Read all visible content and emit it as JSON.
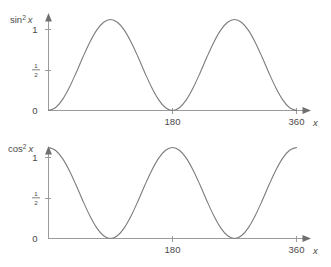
{
  "figure": {
    "background_color": "#ffffff",
    "curve_color": "#7c7c7c",
    "axis_color": "#9b9b9b",
    "text_color": "#4a4a4a"
  },
  "charts": [
    {
      "id": "sin-squared",
      "y_axis_title_base": "sin",
      "y_axis_title_exp": "2",
      "y_axis_title_var": "x",
      "x_axis_title": "x",
      "y_ticks": [
        "1",
        "0"
      ],
      "y_half_num": "1",
      "y_half_den": "2",
      "x_ticks": [
        "180",
        "360"
      ]
    },
    {
      "id": "cos-squared",
      "y_axis_title_base": "cos",
      "y_axis_title_exp": "2",
      "y_axis_title_var": "x",
      "x_axis_title": "x",
      "y_ticks": [
        "1",
        "0"
      ],
      "y_half_num": "1",
      "y_half_den": "2",
      "x_ticks": [
        "180",
        "360"
      ]
    }
  ],
  "chart_data": [
    {
      "type": "line",
      "title": "sin^2 x",
      "xlabel": "x",
      "ylabel": "sin^2 x",
      "xlim": [
        0,
        360
      ],
      "ylim": [
        0,
        1
      ],
      "xticks": [
        180,
        360
      ],
      "yticks": [
        0,
        0.5,
        1
      ],
      "ytick_labels": [
        "0",
        "1/2",
        "1"
      ],
      "grid": false,
      "legend": false,
      "series": [
        {
          "name": "sin^2 x",
          "x": [
            0,
            10,
            20,
            30,
            40,
            50,
            60,
            70,
            80,
            90,
            100,
            110,
            120,
            130,
            140,
            150,
            160,
            170,
            180,
            190,
            200,
            210,
            220,
            230,
            240,
            250,
            260,
            270,
            280,
            290,
            300,
            310,
            320,
            330,
            340,
            350,
            360
          ],
          "y": [
            0.0,
            0.03,
            0.117,
            0.25,
            0.413,
            0.587,
            0.75,
            0.883,
            0.97,
            1.0,
            0.97,
            0.883,
            0.75,
            0.587,
            0.413,
            0.25,
            0.117,
            0.03,
            0.0,
            0.03,
            0.117,
            0.25,
            0.413,
            0.587,
            0.75,
            0.883,
            0.97,
            1.0,
            0.97,
            0.883,
            0.75,
            0.587,
            0.413,
            0.25,
            0.117,
            0.03,
            0.0
          ]
        }
      ]
    },
    {
      "type": "line",
      "title": "cos^2 x",
      "xlabel": "x",
      "ylabel": "cos^2 x",
      "xlim": [
        0,
        360
      ],
      "ylim": [
        0,
        1
      ],
      "xticks": [
        180,
        360
      ],
      "yticks": [
        0,
        0.5,
        1
      ],
      "ytick_labels": [
        "0",
        "1/2",
        "1"
      ],
      "grid": false,
      "legend": false,
      "series": [
        {
          "name": "cos^2 x",
          "x": [
            0,
            10,
            20,
            30,
            40,
            50,
            60,
            70,
            80,
            90,
            100,
            110,
            120,
            130,
            140,
            150,
            160,
            170,
            180,
            190,
            200,
            210,
            220,
            230,
            240,
            250,
            260,
            270,
            280,
            290,
            300,
            310,
            320,
            330,
            340,
            350,
            360
          ],
          "y": [
            1.0,
            0.97,
            0.883,
            0.75,
            0.587,
            0.413,
            0.25,
            0.117,
            0.03,
            0.0,
            0.03,
            0.117,
            0.25,
            0.413,
            0.587,
            0.75,
            0.883,
            0.97,
            1.0,
            0.97,
            0.883,
            0.75,
            0.587,
            0.413,
            0.25,
            0.117,
            0.03,
            0.0,
            0.03,
            0.117,
            0.25,
            0.413,
            0.587,
            0.75,
            0.883,
            0.97,
            1.0
          ]
        }
      ]
    }
  ]
}
